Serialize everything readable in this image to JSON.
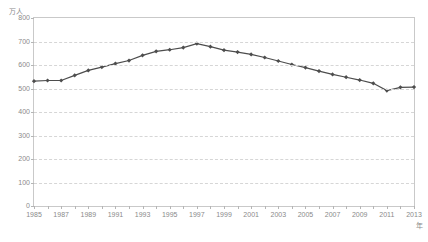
{
  "chart_data": {
    "type": "line",
    "title": "",
    "subtitle": "",
    "xlabel": "年",
    "ylabel": "万人",
    "ylim": [
      0,
      800
    ],
    "xlim": [
      1985,
      2013
    ],
    "grid": true,
    "legend": null,
    "series_color": "#4d4d4d",
    "marker": "diamond",
    "x": [
      1985,
      1986,
      1987,
      1988,
      1989,
      1990,
      1991,
      1992,
      1993,
      1994,
      1995,
      1996,
      1997,
      1998,
      1999,
      2000,
      2001,
      2002,
      2003,
      2004,
      2005,
      2006,
      2007,
      2008,
      2009,
      2010,
      2011,
      2012,
      2013
    ],
    "values": [
      531,
      534,
      534,
      556,
      577,
      591,
      606,
      619,
      641,
      658,
      665,
      674,
      691,
      678,
      663,
      655,
      645,
      632,
      617,
      602,
      589,
      574,
      560,
      548,
      536,
      522,
      491,
      505,
      506
    ],
    "categories": [
      "1985",
      "1986",
      "1987",
      "1988",
      "1989",
      "1990",
      "1991",
      "1992",
      "1993",
      "1994",
      "1995",
      "1996",
      "1997",
      "1998",
      "1999",
      "2000",
      "2001",
      "2002",
      "2003",
      "2004",
      "2005",
      "2006",
      "2007",
      "2008",
      "2009",
      "2010",
      "2011",
      "2012",
      "2013"
    ],
    "ytick_labels": [
      "800",
      "700",
      "600",
      "500",
      "400",
      "300",
      "200",
      "100",
      "0"
    ],
    "ytick_values": [
      800,
      700,
      600,
      500,
      400,
      300,
      200,
      100,
      0
    ],
    "xtick_labels": [
      "1985",
      "1987",
      "1989",
      "1991",
      "1993",
      "1995",
      "1997",
      "1999",
      "2001",
      "2003",
      "2005",
      "2007",
      "2009",
      "2011",
      "2013"
    ],
    "xtick_values": [
      1985,
      1987,
      1989,
      1991,
      1993,
      1995,
      1997,
      1999,
      2001,
      2003,
      2005,
      2007,
      2009,
      2011,
      2013
    ]
  }
}
